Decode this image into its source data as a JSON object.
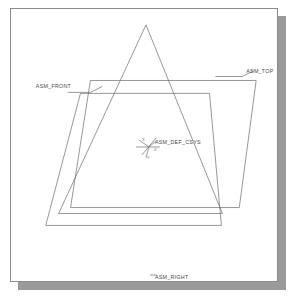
{
  "viewport": {
    "name": "3d-model-viewport",
    "background_color": "#ffffff",
    "frame_color": "#8c8c8c",
    "shadow_color": "#9a9a9a",
    "line_color": "#6b6b6b",
    "label_color": "#4a4a4a"
  },
  "datum_planes": [
    {
      "id": "asm-top",
      "label": "ASM_TOP",
      "label_x": 237,
      "label_y": 64,
      "leader": "M 206 68 L 233 68 L 245 62",
      "outline": "M 80 72 L 247 72 L 230 200 L 60 200 Z"
    },
    {
      "id": "asm-front",
      "label": "ASM_FRONT",
      "label_x": 25,
      "label_y": 80,
      "leader": "M 57 84 L 80 84 L 92 78",
      "outline": "M 70 85 L 200 85 L 212 218 L 35 218 Z"
    },
    {
      "id": "asm-right",
      "label": "ASM_RIGHT",
      "label_x": 145,
      "label_y": 272,
      "leader": "M 140 268 L 147 268",
      "outline": "M 136 16 L 213 206 L 48 206 Z"
    }
  ],
  "coordinate_system": {
    "id": "asm-def-csys",
    "label": "ASM_DEF_CSYS",
    "label_x": 145,
    "label_y": 136,
    "origin_x": 139,
    "origin_y": 139,
    "axes": [
      {
        "name": "x-axis",
        "letter": "X",
        "letter_x": 132,
        "letter_y": 133,
        "path": "M 139 139 L 129 132"
      },
      {
        "name": "y-axis",
        "letter": "Y",
        "letter_x": 137,
        "letter_y": 149,
        "path": "M 139 139 L 136 150"
      },
      {
        "name": "z-axis",
        "letter": "Z",
        "letter_x": 144,
        "letter_y": 142,
        "path": "M 139 139 L 146 133"
      }
    ],
    "cross_h": "M 126 139 L 150 139",
    "cross_d": "M 132 147 L 146 130"
  }
}
